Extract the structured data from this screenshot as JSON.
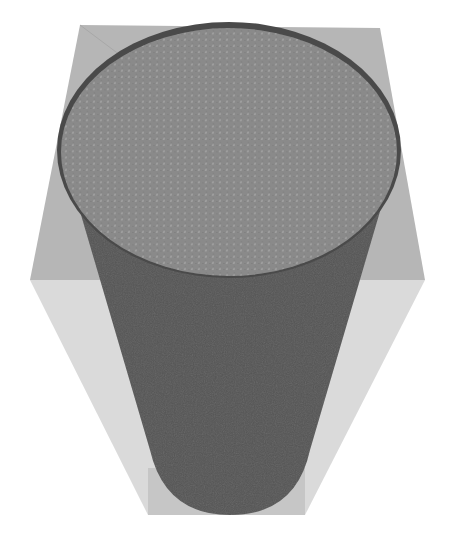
{
  "figure": {
    "colors": {
      "background": "#ffffff",
      "box_top_face": "#b4b4b4",
      "box_side_face": "#d9d9d9",
      "box_inner_face": "#c4c4c4",
      "cylinder_body": "#545454",
      "cylinder_rim": "#4a4a4a",
      "sphere_fill": "#8a8a8a",
      "sphere_highlight": "#a8a8a8",
      "sphere_shadow": "#6e6e6e"
    }
  }
}
